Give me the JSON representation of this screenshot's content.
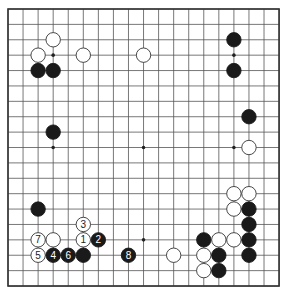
{
  "board": {
    "size": 19,
    "origin_x": 8,
    "origin_y": 9,
    "spacing_x": 15.06,
    "spacing_y": 15.39,
    "line_color": "#555555",
    "border_color": "#333333",
    "background": "#ffffff",
    "star_points": [
      [
        3,
        3
      ],
      [
        9,
        3
      ],
      [
        15,
        3
      ],
      [
        3,
        9
      ],
      [
        9,
        9
      ],
      [
        15,
        9
      ],
      [
        3,
        15
      ],
      [
        9,
        15
      ],
      [
        15,
        15
      ]
    ]
  },
  "colors": {
    "black_stone": "#1a1a1a",
    "white_stone_fill": "#ffffff",
    "white_stone_stroke": "#333333",
    "label_on_black": "#ffffff",
    "label_on_white": "#222222"
  },
  "stones": [
    {
      "color": "white",
      "col": 3,
      "row": 2,
      "label": ""
    },
    {
      "color": "white",
      "col": 2,
      "row": 3,
      "label": ""
    },
    {
      "color": "white",
      "col": 5,
      "row": 3,
      "label": ""
    },
    {
      "color": "white",
      "col": 9,
      "row": 3,
      "label": ""
    },
    {
      "color": "black",
      "col": 2,
      "row": 4,
      "label": ""
    },
    {
      "color": "black",
      "col": 3,
      "row": 4,
      "label": ""
    },
    {
      "color": "black",
      "col": 3,
      "row": 8,
      "label": ""
    },
    {
      "color": "black",
      "col": 15,
      "row": 2,
      "label": ""
    },
    {
      "color": "black",
      "col": 15,
      "row": 4,
      "label": ""
    },
    {
      "color": "black",
      "col": 16,
      "row": 7,
      "label": ""
    },
    {
      "color": "white",
      "col": 16,
      "row": 9,
      "label": ""
    },
    {
      "color": "white",
      "col": 15,
      "row": 12,
      "label": ""
    },
    {
      "color": "white",
      "col": 16,
      "row": 12,
      "label": ""
    },
    {
      "color": "white",
      "col": 15,
      "row": 13,
      "label": ""
    },
    {
      "color": "black",
      "col": 16,
      "row": 13,
      "label": ""
    },
    {
      "color": "black",
      "col": 16,
      "row": 14,
      "label": ""
    },
    {
      "color": "black",
      "col": 13,
      "row": 15,
      "label": ""
    },
    {
      "color": "white",
      "col": 14,
      "row": 15,
      "label": ""
    },
    {
      "color": "white",
      "col": 15,
      "row": 15,
      "label": ""
    },
    {
      "color": "black",
      "col": 16,
      "row": 15,
      "label": ""
    },
    {
      "color": "white",
      "col": 11,
      "row": 16,
      "label": ""
    },
    {
      "color": "white",
      "col": 13,
      "row": 16,
      "label": ""
    },
    {
      "color": "black",
      "col": 14,
      "row": 16,
      "label": ""
    },
    {
      "color": "black",
      "col": 16,
      "row": 16,
      "label": ""
    },
    {
      "color": "white",
      "col": 13,
      "row": 17,
      "label": ""
    },
    {
      "color": "black",
      "col": 14,
      "row": 17,
      "label": ""
    },
    {
      "color": "black",
      "col": 2,
      "row": 13,
      "label": ""
    },
    {
      "color": "white",
      "col": 5,
      "row": 14,
      "label": "3"
    },
    {
      "color": "white",
      "col": 2,
      "row": 15,
      "label": "7"
    },
    {
      "color": "white",
      "col": 3,
      "row": 15,
      "label": ""
    },
    {
      "color": "white",
      "col": 5,
      "row": 15,
      "label": "1"
    },
    {
      "color": "black",
      "col": 6,
      "row": 15,
      "label": "2"
    },
    {
      "color": "white",
      "col": 2,
      "row": 16,
      "label": "5"
    },
    {
      "color": "black",
      "col": 3,
      "row": 16,
      "label": "4"
    },
    {
      "color": "black",
      "col": 4,
      "row": 16,
      "label": "6"
    },
    {
      "color": "black",
      "col": 5,
      "row": 16,
      "label": ""
    },
    {
      "color": "black",
      "col": 8,
      "row": 16,
      "label": "8"
    }
  ]
}
